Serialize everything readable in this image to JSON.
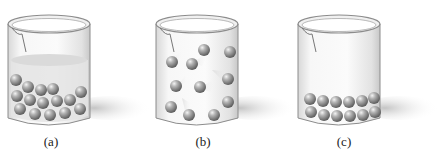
{
  "figure": {
    "panels": [
      {
        "id": "a",
        "label": "(a)",
        "state": "liquid",
        "sphere_count": 17
      },
      {
        "id": "b",
        "label": "(b)",
        "state": "gas",
        "sphere_count": 11
      },
      {
        "id": "c",
        "label": "(c)",
        "state": "solid",
        "sphere_count": 12
      }
    ]
  },
  "colors": {
    "glass_edge": "#8c8c8c",
    "liquid": "#e4e4e4",
    "sphere": "#9a9a9a",
    "shadow": "#cfcfcf"
  }
}
